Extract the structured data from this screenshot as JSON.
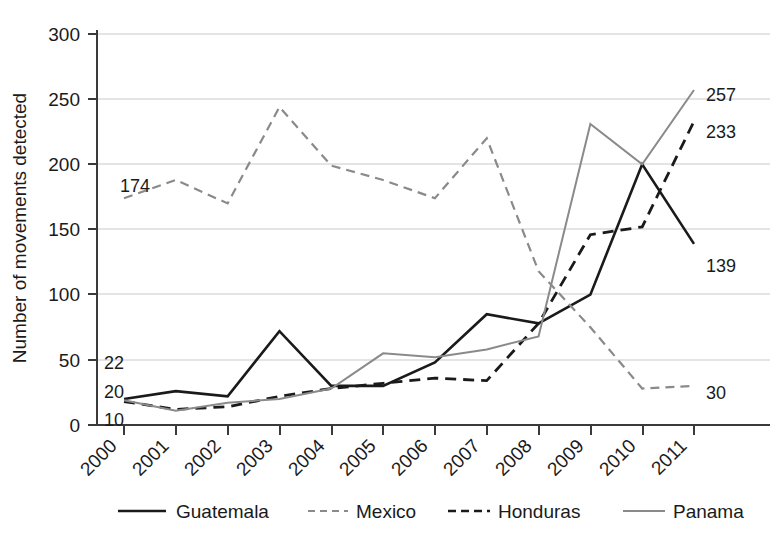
{
  "chart_data": {
    "type": "line",
    "title": "",
    "subtitle": "",
    "xlabel": "",
    "ylabel": "Number of movements detected",
    "x": [
      "2000",
      "2001",
      "2002",
      "2003",
      "2004",
      "2005",
      "2006",
      "2007",
      "2008",
      "2009",
      "2010",
      "2011"
    ],
    "categories": [
      "2000",
      "2001",
      "2002",
      "2003",
      "2004",
      "2005",
      "2006",
      "2007",
      "2008",
      "2009",
      "2010",
      "2011"
    ],
    "xlim": [
      2000,
      2011
    ],
    "ylim": [
      0,
      300
    ],
    "yticks": [
      0,
      50,
      100,
      150,
      200,
      250,
      300
    ],
    "xticks": [
      "2000",
      "2001",
      "2002",
      "2003",
      "2004",
      "2005",
      "2006",
      "2007",
      "2008",
      "2009",
      "2010",
      "2011"
    ],
    "grid": "horizontal",
    "legend_position": "bottom",
    "series": [
      {
        "name": "Guatemala",
        "style": "solid",
        "color": "#1a1a1a",
        "values": [
          20,
          26,
          22,
          72,
          30,
          30,
          48,
          85,
          78,
          100,
          200,
          139
        ]
      },
      {
        "name": "Mexico",
        "style": "dashed",
        "color": "#8a8a8a",
        "values": [
          174,
          188,
          170,
          244,
          199,
          188,
          174,
          220,
          118,
          75,
          28,
          30
        ]
      },
      {
        "name": "Honduras",
        "style": "dashed",
        "color": "#1a1a1a",
        "values": [
          18,
          12,
          14,
          22,
          28,
          32,
          36,
          34,
          78,
          146,
          152,
          233
        ]
      },
      {
        "name": "Panama",
        "style": "solid",
        "color": "#8a8a8a",
        "values": [
          19,
          11,
          17,
          20,
          28,
          55,
          52,
          58,
          68,
          231,
          200,
          257
        ]
      }
    ],
    "annotations": [
      {
        "text": "174",
        "series": "Mexico",
        "x": "2000",
        "value": 174,
        "side": "left"
      },
      {
        "text": "22",
        "series": "Guatemala",
        "x": "2000",
        "value": 22,
        "side": "left"
      },
      {
        "text": "20",
        "series": "Panama",
        "x": "2000",
        "value": 20,
        "side": "left"
      },
      {
        "text": "10",
        "series": "Honduras",
        "x": "2000",
        "value": 10,
        "side": "left"
      },
      {
        "text": "257",
        "series": "Panama",
        "x": "2011",
        "value": 257,
        "side": "right"
      },
      {
        "text": "233",
        "series": "Honduras",
        "x": "2011",
        "value": 233,
        "side": "right"
      },
      {
        "text": "139",
        "series": "Guatemala",
        "x": "2011",
        "value": 139,
        "side": "right"
      },
      {
        "text": "30",
        "series": "Mexico",
        "x": "2011",
        "value": 30,
        "side": "right"
      }
    ]
  },
  "axis": {
    "ylabel": "Number of movements detected",
    "yticks": {
      "t0": "0",
      "t1": "50",
      "t2": "100",
      "t3": "150",
      "t4": "200",
      "t5": "250",
      "t6": "300"
    },
    "xticks": {
      "x0": "2000",
      "x1": "2001",
      "x2": "2002",
      "x3": "2003",
      "x4": "2004",
      "x5": "2005",
      "x6": "2006",
      "x7": "2007",
      "x8": "2008",
      "x9": "2009",
      "x10": "2010",
      "x11": "2011"
    }
  },
  "labels": {
    "left": {
      "mexico": "174",
      "guatemala": "22",
      "panama": "20",
      "honduras": "10"
    },
    "right": {
      "panama": "257",
      "honduras": "233",
      "guatemala": "139",
      "mexico": "30"
    }
  },
  "legend": {
    "items": {
      "i0": "Guatemala",
      "i1": "Mexico",
      "i2": "Honduras",
      "i3": "Panama"
    }
  },
  "colors": {
    "dark": "#1a1a1a",
    "gray": "#8a8a8a",
    "grid": "#c9c9c9",
    "axis": "#5a5a5a",
    "background": "#ffffff"
  }
}
